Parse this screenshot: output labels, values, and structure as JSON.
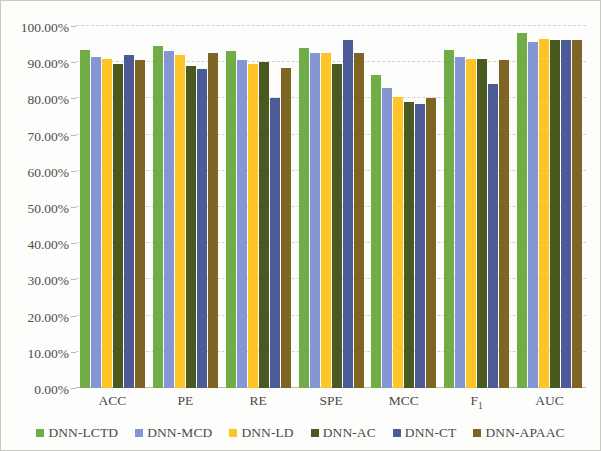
{
  "chart_data": {
    "type": "bar",
    "title": "",
    "subtitle": "",
    "xlabel": "",
    "ylabel": "",
    "ylim": [
      0,
      100
    ],
    "ytick_values": [
      0,
      10,
      20,
      30,
      40,
      50,
      60,
      70,
      80,
      90,
      100
    ],
    "ytick_labels": [
      "0.00%",
      "10.00%",
      "20.00%",
      "30.00%",
      "40.00%",
      "50.00%",
      "60.00%",
      "70.00%",
      "80.00%",
      "90.00%",
      "100.00%"
    ],
    "grid": true,
    "legend_position": "bottom",
    "categories": [
      "ACC",
      "PE",
      "RE",
      "SPE",
      "MCC",
      "F₁",
      "AUC"
    ],
    "category_labels_html": [
      "ACC",
      "PE",
      "RE",
      "SPE",
      "MCC",
      "F<sub>1</sub>",
      "AUC"
    ],
    "series": [
      {
        "name": "DNN-LCTD",
        "color": "#70ad47",
        "values": [
          93.5,
          94.5,
          93.0,
          94.0,
          86.5,
          93.5,
          98.0
        ]
      },
      {
        "name": "DNN-MCD",
        "color": "#8496d4",
        "values": [
          91.5,
          93.0,
          90.5,
          92.5,
          83.0,
          91.5,
          95.5
        ]
      },
      {
        "name": "DNN-LD",
        "color": "#ffc425",
        "values": [
          91.0,
          92.0,
          89.5,
          92.5,
          80.5,
          91.0,
          96.5
        ]
      },
      {
        "name": "DNN-AC",
        "color": "#49591f",
        "values": [
          89.5,
          89.0,
          90.0,
          89.5,
          79.0,
          91.0,
          96.0
        ]
      },
      {
        "name": "DNN-CT",
        "color": "#4c5a95",
        "values": [
          92.0,
          88.0,
          80.0,
          96.0,
          78.5,
          84.0,
          96.0
        ]
      },
      {
        "name": "DNN-APAAC",
        "color": "#7f6524",
        "values": [
          90.5,
          92.5,
          88.5,
          92.5,
          80.0,
          90.5,
          96.0
        ]
      }
    ]
  },
  "colors": {
    "background": "#fdfdfc",
    "frame": "#c9c9c4",
    "gridline": "#d2d2cd",
    "text": "#4a4a48"
  }
}
